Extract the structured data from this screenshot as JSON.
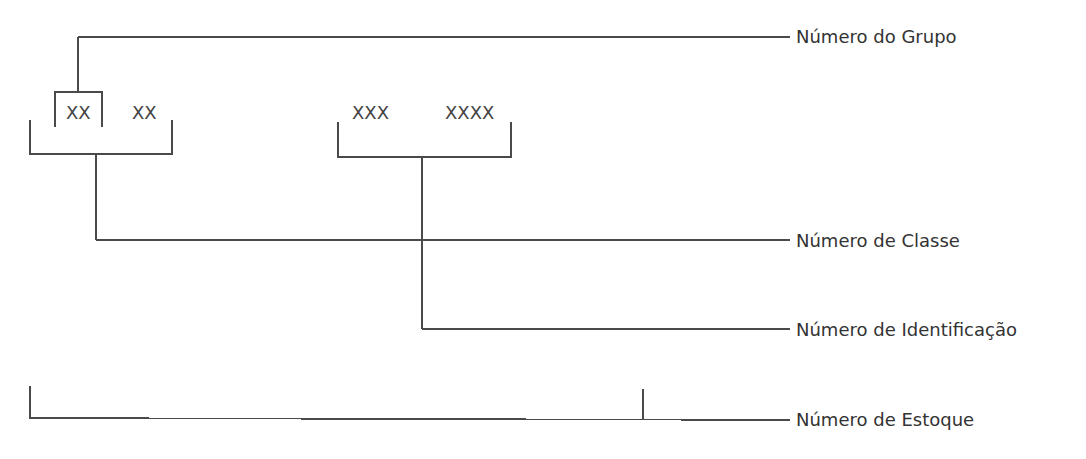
{
  "diagram": {
    "codes": {
      "group": "XX",
      "class": "XX",
      "id_part1": "XXX",
      "id_part2": "XXXX"
    },
    "labels": {
      "group": "Número do Grupo",
      "class": "Número de Classe",
      "identification": "Número de Identificação",
      "stock": "Número de Estoque"
    },
    "colors": {
      "line": "#4a4a4a",
      "text": "#333333",
      "background": "#ffffff"
    }
  }
}
